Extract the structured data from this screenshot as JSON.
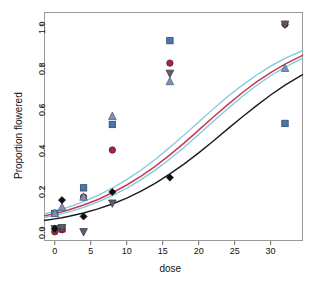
{
  "chart_data": {
    "type": "scatter",
    "title": "",
    "subtitle": "",
    "xlabel": "dose",
    "ylabel": "Proportion flowered",
    "xlim": [
      -1.5,
      34.5
    ],
    "ylim": [
      -0.06,
      1.06
    ],
    "xticks": [
      0,
      5,
      10,
      15,
      20,
      25,
      30
    ],
    "xtick_labels": [
      "0",
      "5",
      "10",
      "15",
      "20",
      "25",
      "30"
    ],
    "yticks": [
      0.0,
      0.2,
      0.4,
      0.6,
      0.8,
      1.0
    ],
    "ytick_labels": [
      "0.0",
      "0.2",
      "0.4",
      "0.6",
      "0.8",
      "1.0"
    ],
    "grid": false,
    "legend": "none",
    "series": [
      {
        "name": "group-square",
        "marker": "square",
        "color": "#4a77a8",
        "x": [
          0,
          1,
          4,
          8,
          16,
          32
        ],
        "y": [
          0.075,
          0.0,
          0.2,
          0.51,
          0.92,
          0.515
        ]
      },
      {
        "name": "group-circle",
        "marker": "circle",
        "color": "#9e2743",
        "x": [
          0,
          1,
          4,
          8,
          16,
          32
        ],
        "y": [
          -0.015,
          -0.005,
          0.155,
          0.385,
          0.81,
          1.0
        ]
      },
      {
        "name": "group-down-triangle",
        "marker": "triangle-down",
        "color": "#5d5d6e",
        "x": [
          0,
          1,
          4,
          8,
          16,
          32
        ],
        "y": [
          0.0,
          0.005,
          -0.015,
          0.125,
          0.76,
          1.0
        ]
      },
      {
        "name": "group-up-triangle",
        "marker": "triangle-up",
        "color": "#7d93b5",
        "x": [
          0,
          1,
          4,
          8,
          16,
          32
        ],
        "y": [
          0.075,
          0.105,
          0.155,
          0.55,
          0.72,
          0.785
        ]
      },
      {
        "name": "group-diamond",
        "marker": "diamond",
        "color": "#101010",
        "x": [
          0,
          1,
          4,
          8,
          16
        ],
        "y": [
          0.0,
          0.14,
          0.06,
          0.18,
          0.25
        ]
      }
    ],
    "curves": [
      {
        "name": "fit-upper-cyan",
        "color": "#7fc7e0",
        "width": 1.3,
        "points": [
          [
            -1.5,
            0.072
          ],
          [
            0,
            0.086
          ],
          [
            1,
            0.096
          ],
          [
            2,
            0.107
          ],
          [
            4,
            0.133
          ],
          [
            6,
            0.163
          ],
          [
            8,
            0.199
          ],
          [
            10,
            0.24
          ],
          [
            12,
            0.287
          ],
          [
            14,
            0.34
          ],
          [
            16,
            0.398
          ],
          [
            18,
            0.459
          ],
          [
            20,
            0.522
          ],
          [
            22,
            0.585
          ],
          [
            24,
            0.645
          ],
          [
            26,
            0.7
          ],
          [
            28,
            0.751
          ],
          [
            30,
            0.795
          ],
          [
            32,
            0.833
          ],
          [
            34.5,
            0.872
          ]
        ]
      },
      {
        "name": "fit-red",
        "color": "#c8394f",
        "width": 1.5,
        "points": [
          [
            -1.5,
            0.062
          ],
          [
            0,
            0.074
          ],
          [
            1,
            0.083
          ],
          [
            2,
            0.093
          ],
          [
            4,
            0.116
          ],
          [
            6,
            0.143
          ],
          [
            8,
            0.176
          ],
          [
            10,
            0.214
          ],
          [
            12,
            0.257
          ],
          [
            14,
            0.306
          ],
          [
            16,
            0.361
          ],
          [
            18,
            0.42
          ],
          [
            20,
            0.482
          ],
          [
            22,
            0.545
          ],
          [
            24,
            0.606
          ],
          [
            26,
            0.664
          ],
          [
            28,
            0.717
          ],
          [
            30,
            0.764
          ],
          [
            32,
            0.805
          ],
          [
            34.5,
            0.849
          ]
        ]
      },
      {
        "name": "fit-lower-cyan",
        "color": "#7fc7e0",
        "width": 1.3,
        "points": [
          [
            -1.5,
            0.055
          ],
          [
            0,
            0.066
          ],
          [
            1,
            0.074
          ],
          [
            2,
            0.083
          ],
          [
            4,
            0.105
          ],
          [
            6,
            0.131
          ],
          [
            8,
            0.162
          ],
          [
            10,
            0.198
          ],
          [
            12,
            0.24
          ],
          [
            14,
            0.288
          ],
          [
            16,
            0.341
          ],
          [
            18,
            0.399
          ],
          [
            20,
            0.461
          ],
          [
            22,
            0.524
          ],
          [
            24,
            0.586
          ],
          [
            26,
            0.645
          ],
          [
            28,
            0.699
          ],
          [
            30,
            0.748
          ],
          [
            32,
            0.79
          ],
          [
            34.5,
            0.836
          ]
        ]
      },
      {
        "name": "fit-black",
        "color": "#1c1c1c",
        "width": 1.4,
        "points": [
          [
            -1.5,
            0.04
          ],
          [
            0,
            0.048
          ],
          [
            1,
            0.054
          ],
          [
            2,
            0.061
          ],
          [
            4,
            0.077
          ],
          [
            6,
            0.097
          ],
          [
            8,
            0.121
          ],
          [
            10,
            0.15
          ],
          [
            12,
            0.184
          ],
          [
            14,
            0.223
          ],
          [
            16,
            0.268
          ],
          [
            18,
            0.317
          ],
          [
            20,
            0.371
          ],
          [
            22,
            0.428
          ],
          [
            24,
            0.487
          ],
          [
            26,
            0.545
          ],
          [
            28,
            0.601
          ],
          [
            30,
            0.654
          ],
          [
            32,
            0.702
          ],
          [
            34.5,
            0.755
          ]
        ]
      }
    ]
  }
}
